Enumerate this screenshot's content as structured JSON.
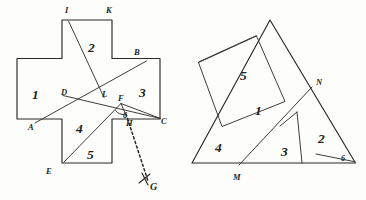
{
  "plate": {
    "title": "Geometric dissection plate",
    "background_color": "#fdfdfb",
    "ink_color": "#2b2824"
  },
  "figures": [
    {
      "id": "left-figure",
      "name": "greek-cross-dissection",
      "shape": "greek cross",
      "piece_count": 5,
      "pieces": [
        {
          "label": "1",
          "x": 36,
          "y": 93
        },
        {
          "label": "2",
          "x": 93,
          "y": 46
        },
        {
          "label": "3",
          "x": 143,
          "y": 91
        },
        {
          "label": "4",
          "x": 82,
          "y": 127
        },
        {
          "label": "5",
          "x": 92,
          "y": 153
        }
      ],
      "vertex_labels": [
        {
          "label": "I",
          "x": 68,
          "y": 14
        },
        {
          "label": "K",
          "x": 109,
          "y": 14
        },
        {
          "label": "B",
          "x": 138,
          "y": 55
        },
        {
          "label": "D",
          "x": 66,
          "y": 92
        },
        {
          "label": "L",
          "x": 101,
          "y": 93
        },
        {
          "label": "F",
          "x": 122,
          "y": 101
        },
        {
          "label": "C",
          "x": 163,
          "y": 120
        },
        {
          "label": "A",
          "x": 33,
          "y": 126
        },
        {
          "label": "H",
          "x": 129,
          "y": 123
        },
        {
          "label": "E",
          "x": 50,
          "y": 170
        },
        {
          "label": "G",
          "x": 152,
          "y": 188
        },
        {
          "label": "6",
          "x": 126,
          "y": 116
        }
      ]
    },
    {
      "id": "right-figure",
      "name": "triangle-dissection",
      "shape": "triangle",
      "piece_count": 6,
      "pieces": [
        {
          "label": "5",
          "x": 245,
          "y": 74
        },
        {
          "label": "1",
          "x": 260,
          "y": 109
        },
        {
          "label": "4",
          "x": 221,
          "y": 146
        },
        {
          "label": "3",
          "x": 286,
          "y": 150
        },
        {
          "label": "2",
          "x": 323,
          "y": 137
        },
        {
          "label": "6",
          "x": 344,
          "y": 159
        }
      ],
      "vertex_labels": [
        {
          "label": "N",
          "x": 319,
          "y": 85
        },
        {
          "label": "M",
          "x": 237,
          "y": 178
        }
      ]
    }
  ],
  "geometry": {
    "cross_outline": "62,19 112,19 112,58 160,58 160,119 112,119 112,163 62,163 62,119 17,119 17,58 62,58",
    "cross_cut_I_to_L": "68,20 103,97",
    "cross_cut_A_to_B": "36,122 146,61",
    "cross_cut_D_to_C": "63,95 160,118",
    "cross_cut_E_to_F": "64,162 120,104",
    "cross_dashed_H_to_G": "126,112 148,183",
    "cross_tick_G": "143,181 153,172",
    "cross_tick_G2": "146,170 152,183",
    "cross_angle_arc_F": "M 116,109 A 9 9 0 0 0 124,113",
    "triangle_outline": "270,20 355,163 192,163",
    "tri_square_1": "256,36 284,101 222,126 198,62",
    "tri_cut_M_N": "239,166 311,88",
    "tri_cut_3": "296,113 301,163",
    "tri_cut_2_right": "301,163 352,163",
    "tri_cut_6": "316,155 353,162"
  }
}
